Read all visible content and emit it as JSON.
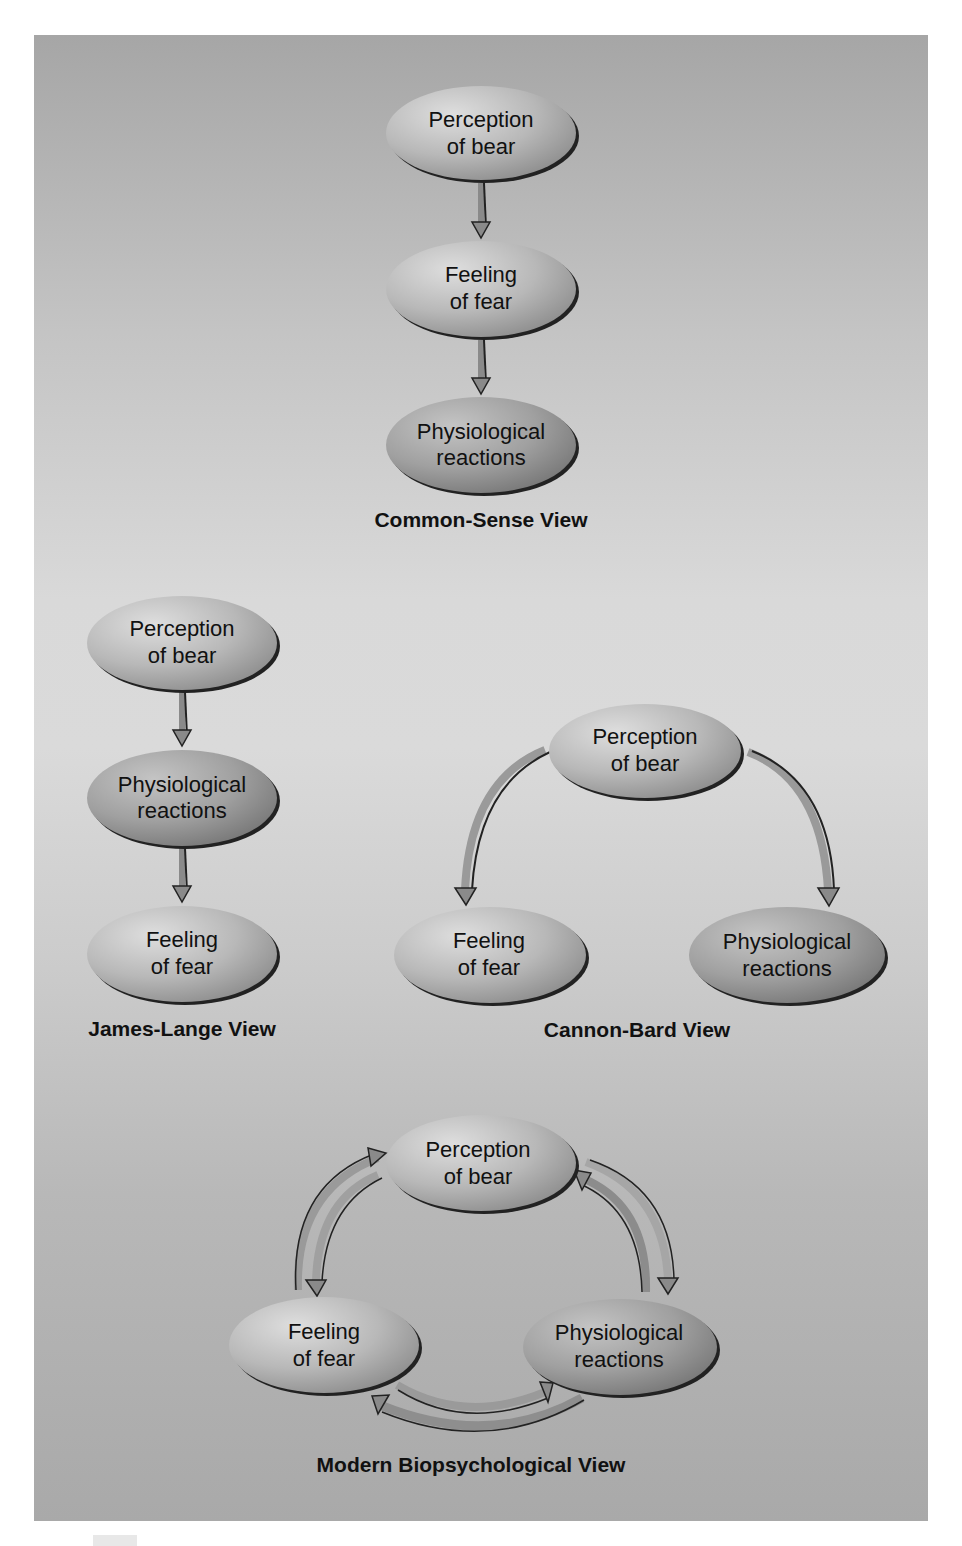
{
  "figure": {
    "sections": [
      {
        "id": "common-sense",
        "title": "Common-Sense View",
        "nodes": [
          {
            "line1": "Perception",
            "line2": "of bear"
          },
          {
            "line1": "Feeling",
            "line2": "of fear"
          },
          {
            "line1": "Physiological",
            "line2": "reactions"
          }
        ],
        "flow": [
          "Perception of bear → Feeling of fear",
          "Feeling of fear → Physiological reactions"
        ]
      },
      {
        "id": "james-lange",
        "title": "James-Lange View",
        "nodes": [
          {
            "line1": "Perception",
            "line2": "of bear"
          },
          {
            "line1": "Physiological",
            "line2": "reactions"
          },
          {
            "line1": "Feeling",
            "line2": "of fear"
          }
        ],
        "flow": [
          "Perception of bear → Physiological reactions",
          "Physiological reactions → Feeling of fear"
        ]
      },
      {
        "id": "cannon-bard",
        "title": "Cannon-Bard View",
        "nodes": [
          {
            "line1": "Perception",
            "line2": "of bear"
          },
          {
            "line1": "Feeling",
            "line2": "of fear"
          },
          {
            "line1": "Physiological",
            "line2": "reactions"
          }
        ],
        "flow": [
          "Perception of bear → Feeling of fear",
          "Perception of bear → Physiological reactions"
        ]
      },
      {
        "id": "modern-biopsychological",
        "title": "Modern Biopsychological View",
        "nodes": [
          {
            "line1": "Perception",
            "line2": "of bear"
          },
          {
            "line1": "Feeling",
            "line2": "of fear"
          },
          {
            "line1": "Physiological",
            "line2": "reactions"
          }
        ],
        "flow": [
          "Perception of bear ↔ Feeling of fear",
          "Perception of bear ↔ Physiological reactions",
          "Feeling of fear ↔ Physiological reactions"
        ]
      }
    ],
    "colors": {
      "node_light": "#d6d6d6",
      "node_dark": "#8e8e8e",
      "node_outline": "#222222",
      "arrow_fill": "#8a8a8a",
      "arrow_edge": "#1a1a1a",
      "background": "#c8c8c8"
    }
  }
}
